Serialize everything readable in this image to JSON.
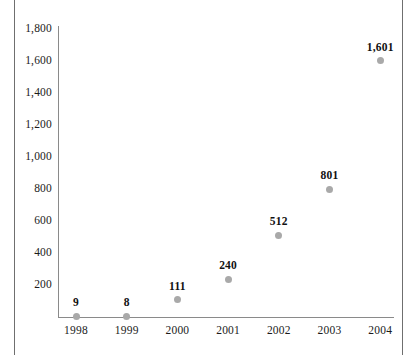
{
  "chart_data": {
    "type": "scatter",
    "title": "",
    "xlabel": "",
    "ylabel": "",
    "categories": [
      "1998",
      "1999",
      "2000",
      "2001",
      "2002",
      "2003",
      "2004"
    ],
    "values": [
      9,
      8,
      111,
      240,
      512,
      801,
      1601
    ],
    "point_labels": [
      "9",
      "8",
      "111",
      "240",
      "512",
      "801",
      "1,601"
    ],
    "ylim": [
      0,
      1800
    ],
    "ytick_values": [
      200,
      400,
      600,
      800,
      1000,
      1200,
      1400,
      1600,
      1800
    ],
    "ytick_labels": [
      "200",
      "400",
      "600",
      "800",
      "1,000",
      "1,200",
      "1,400",
      "1,600",
      "1,800"
    ],
    "grid": false,
    "legend": "none",
    "marker_color": "#a9a9a9",
    "axis_color": "#8a8a8a",
    "label_color": "#111111"
  }
}
